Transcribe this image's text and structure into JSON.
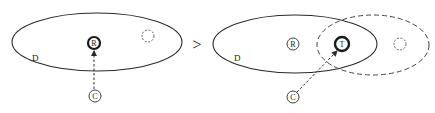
{
  "diagram": {
    "relation_symbol": ">",
    "left_panel": {
      "region_label": "D",
      "nodes": [
        {
          "id": "R",
          "label": "R",
          "emphasis": "bold"
        },
        {
          "id": "C",
          "label": "C",
          "emphasis": "normal"
        },
        {
          "id": "placeholder",
          "label": "",
          "style": "dashed"
        }
      ],
      "edges": [
        {
          "from": "C",
          "to": "R",
          "style": "dashed-arrow"
        }
      ]
    },
    "right_panel": {
      "region_label": "D",
      "nodes": [
        {
          "id": "R",
          "label": "R",
          "emphasis": "normal"
        },
        {
          "id": "T",
          "label": "T",
          "emphasis": "bold"
        },
        {
          "id": "C",
          "label": "C",
          "emphasis": "normal"
        },
        {
          "id": "placeholder",
          "label": "",
          "style": "dashed"
        }
      ],
      "regions": [
        {
          "id": "D",
          "style": "solid"
        },
        {
          "id": "T-region",
          "style": "dashed"
        }
      ],
      "edges": [
        {
          "from": "C",
          "to": "T",
          "style": "dashed-arrow"
        }
      ]
    },
    "colors": {
      "stroke": "#2a2a2a",
      "background": "#ffffff"
    }
  }
}
